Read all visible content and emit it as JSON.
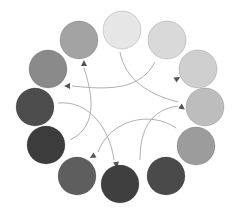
{
  "diagram": {
    "type": "color-wheel",
    "circles": [
      {
        "id": "top",
        "cx": 122,
        "cy": 30,
        "r": 19,
        "color": "#e6e6e6"
      },
      {
        "id": "upper-right",
        "cx": 167,
        "cy": 40,
        "r": 19,
        "color": "#d9d9d9"
      },
      {
        "id": "right-1",
        "cx": 198,
        "cy": 69,
        "r": 19,
        "color": "#cfcfcf"
      },
      {
        "id": "right-2",
        "cx": 205,
        "cy": 107,
        "r": 19,
        "color": "#bdbdbd"
      },
      {
        "id": "right-3",
        "cx": 196,
        "cy": 146,
        "r": 19,
        "color": "#9c9c9c"
      },
      {
        "id": "bottom-right",
        "cx": 166,
        "cy": 176,
        "r": 19,
        "color": "#4a4a4a"
      },
      {
        "id": "bottom",
        "cx": 120,
        "cy": 184,
        "r": 19,
        "color": "#3f3f3f"
      },
      {
        "id": "bottom-left",
        "cx": 77,
        "cy": 176,
        "r": 19,
        "color": "#5e5e5e"
      },
      {
        "id": "left-3",
        "cx": 46,
        "cy": 145,
        "r": 19,
        "color": "#3c3c3c"
      },
      {
        "id": "left-2",
        "cx": 35,
        "cy": 107,
        "r": 19,
        "color": "#4d4d4d"
      },
      {
        "id": "left-1",
        "cx": 48,
        "cy": 69,
        "r": 19,
        "color": "#8a8a8a"
      },
      {
        "id": "top-left",
        "cx": 79,
        "cy": 40,
        "r": 19,
        "color": "#a3a3a3"
      }
    ],
    "arrows": [
      {
        "d": "M120 52 C125 80,150 95,178 102",
        "head": {
          "x": 180,
          "y": 106,
          "angle": 35
        }
      },
      {
        "d": "M155 62 C140 90,110 90,72 86",
        "head": {
          "x": 70,
          "y": 86,
          "angle": 180
        }
      },
      {
        "d": "M178 106 C150 110,140 130,140 160",
        "head": {
          "x": 175,
          "y": 80,
          "angle": -30
        }
      },
      {
        "d": "M58 103 C90 100,110 130,114 160",
        "head": {
          "x": 116,
          "y": 162,
          "angle": 80
        }
      },
      {
        "d": "M176 128 C150 110,110 120,98 152",
        "head": {
          "x": 95,
          "y": 155,
          "angle": 150
        }
      },
      {
        "d": "M70 140 C90 130,98 110,84 68",
        "head": {
          "x": 84,
          "y": 66,
          "angle": -90
        }
      }
    ],
    "arrow_color": "#b0b0b0"
  }
}
